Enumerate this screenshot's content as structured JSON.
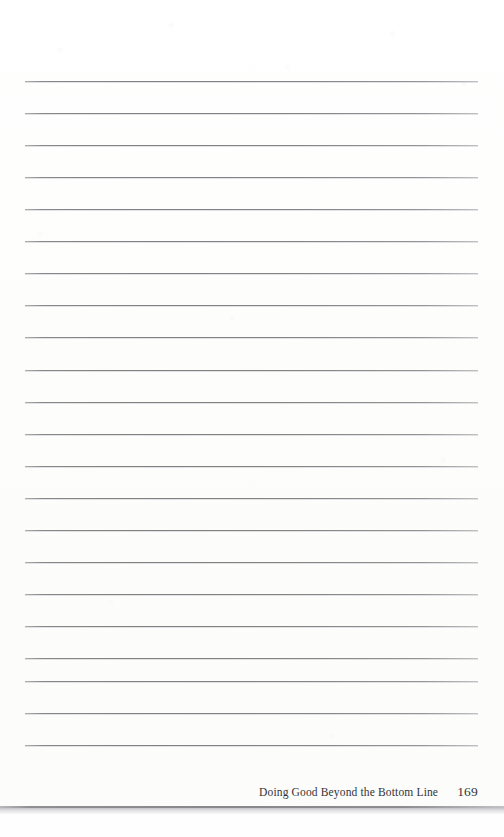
{
  "document": {
    "type": "scanned-book-page",
    "orientation": "portrait",
    "background_color": "#fdfdfc"
  },
  "notes_area": {
    "label": "Blank ruled note-taking lines",
    "line_count": 22,
    "line_color": "#7c7c80",
    "first_line_y": 81,
    "line_spacing": 32.3,
    "line_left_x": 25,
    "line_right_x": 478,
    "lines": [
      {
        "index": 1,
        "y": 81
      },
      {
        "index": 2,
        "y": 113
      },
      {
        "index": 3,
        "y": 145
      },
      {
        "index": 4,
        "y": 177
      },
      {
        "index": 5,
        "y": 209
      },
      {
        "index": 6,
        "y": 241
      },
      {
        "index": 7,
        "y": 273
      },
      {
        "index": 8,
        "y": 305
      },
      {
        "index": 9,
        "y": 337
      },
      {
        "index": 10,
        "y": 370
      },
      {
        "index": 11,
        "y": 402
      },
      {
        "index": 12,
        "y": 434
      },
      {
        "index": 13,
        "y": 466
      },
      {
        "index": 14,
        "y": 498
      },
      {
        "index": 15,
        "y": 530
      },
      {
        "index": 16,
        "y": 562
      },
      {
        "index": 17,
        "y": 594
      },
      {
        "index": 18,
        "y": 626
      },
      {
        "index": 19,
        "y": 658
      },
      {
        "index": 20,
        "y": 681
      },
      {
        "index": 21,
        "y": 713
      },
      {
        "index": 22,
        "y": 745
      }
    ]
  },
  "footer": {
    "title": "Doing Good Beyond the Bottom Line",
    "page_number": "169",
    "text_color": "#343436"
  },
  "page_edge": {
    "label": "bottom page edge shadow band",
    "rule_color": "#87878c",
    "band_color": "#afafb4"
  }
}
